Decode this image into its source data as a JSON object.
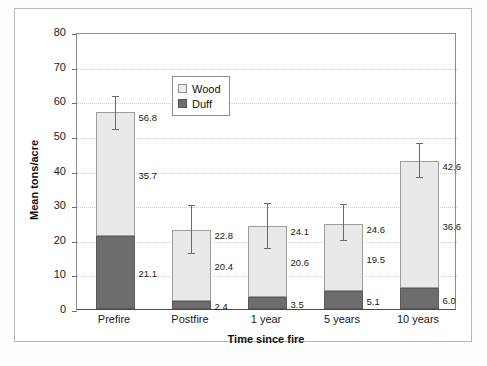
{
  "chart_data": {
    "type": "bar",
    "subtype": "stacked-bar-with-error-bars",
    "title": "",
    "xlabel": "Time since fire",
    "ylabel": "Mean tons/acre",
    "ylim": [
      0,
      80
    ],
    "ytick_step": 10,
    "yticks": [
      "80",
      "70",
      "60",
      "50",
      "40",
      "30",
      "20",
      "10",
      "0"
    ],
    "grid": true,
    "grid_style": "dotted-horizontal",
    "legend_position": "top-left-inside",
    "categories": [
      "Prefire",
      "Postfire",
      "1 year",
      "5 years",
      "10 years"
    ],
    "series": [
      {
        "name": "Wood",
        "color": "#e9e9e9",
        "values": [
          35.7,
          20.4,
          20.6,
          19.5,
          36.6
        ]
      },
      {
        "name": "Duff",
        "color": "#6d6d6d",
        "values": [
          21.1,
          2.4,
          3.5,
          5.1,
          6.0
        ]
      }
    ],
    "totals": [
      56.8,
      22.8,
      24.1,
      24.6,
      42.6
    ],
    "error_bars": [
      {
        "category": "Prefire",
        "low": 52.0,
        "high": 61.5
      },
      {
        "category": "Postfire",
        "low": 16.2,
        "high": 30.0
      },
      {
        "category": "1 year",
        "low": 17.6,
        "high": 30.6
      },
      {
        "category": "5 years",
        "low": 20.0,
        "high": 30.2
      },
      {
        "category": "10 years",
        "low": 38.0,
        "high": 48.0
      }
    ],
    "value_labels": {
      "Prefire": {
        "total": "56.8",
        "wood": "35.7",
        "duff": "21.1"
      },
      "Postfire": {
        "total": "22.8",
        "wood": "20.4",
        "duff": "2.4"
      },
      "1 year": {
        "total": "24.1",
        "wood": "20.6",
        "duff": "3.5"
      },
      "5 years": {
        "total": "24.6",
        "wood": "19.5",
        "duff": "5.1"
      },
      "10 years": {
        "total": "42.6",
        "wood": "36.6",
        "duff": "6.0"
      }
    }
  },
  "legend": {
    "items": [
      {
        "label": "Wood"
      },
      {
        "label": "Duff"
      }
    ]
  }
}
